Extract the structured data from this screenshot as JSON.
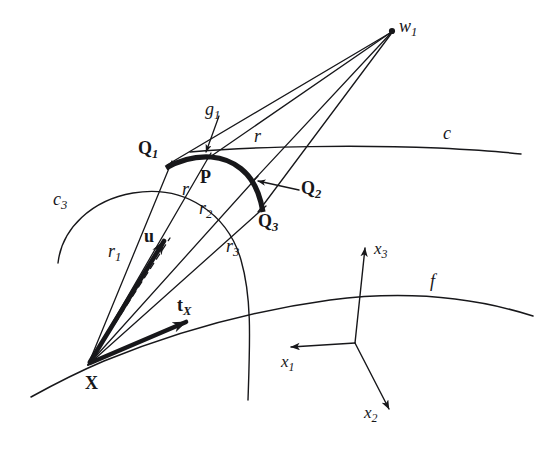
{
  "figure": {
    "type": "geometric-diagram",
    "background_color": "#ffffff",
    "ink_color": "#17171a",
    "width": 555,
    "height": 463
  },
  "labels": {
    "w1": "w",
    "w1_sub": "1",
    "g1": "g",
    "g1_sub": "1",
    "c": "c",
    "c3": "c",
    "c3_sub": "3",
    "f": "f",
    "Q1": "Q",
    "Q1_sub": "1",
    "Q2": "Q",
    "Q2_sub": "2",
    "Q3": "Q",
    "Q3_sub": "3",
    "P": "P",
    "X": "X",
    "u": "u",
    "tX": "t",
    "tX_sub": "X",
    "r": "r",
    "r_upper": "r",
    "r1": "r",
    "r1_sub": "1",
    "r2": "r",
    "r2_sub": "2",
    "r3": "r",
    "r3_sub": "3",
    "x1": "x",
    "x1_sub": "1",
    "x2": "x",
    "x2_sub": "2",
    "x3": "x",
    "x3_sub": "3"
  },
  "geometry": {
    "points": {
      "X": [
        88,
        365
      ],
      "P": [
        207,
        158
      ],
      "Q1": [
        168,
        166
      ],
      "Q2": [
        253,
        182
      ],
      "Q3": [
        258,
        211
      ],
      "w1": [
        392,
        31
      ],
      "u_tip": [
        168,
        235
      ],
      "tX_tip": [
        194,
        317
      ],
      "axes_origin": [
        355,
        343
      ],
      "x1_tip": [
        284,
        347
      ],
      "x2_tip": [
        393,
        414
      ],
      "x3_tip": [
        365,
        241
      ]
    },
    "rays_from_X": [
      "r1",
      "r",
      "r2",
      "r3"
    ],
    "rays_to_w1": [
      "Q1",
      "P",
      "Q2",
      "Q3"
    ],
    "thick_arc": "Q1-P-Q2-Q3",
    "vectors": [
      "u",
      "tX"
    ],
    "dashed_line": "X to u_tip projection",
    "curves": [
      "c",
      "c3",
      "f"
    ]
  }
}
